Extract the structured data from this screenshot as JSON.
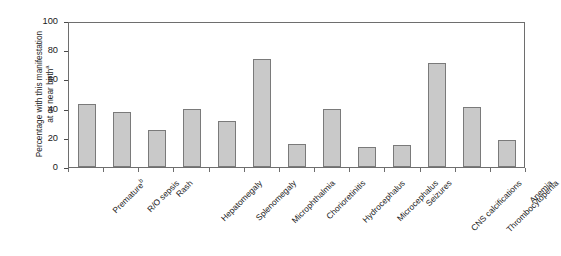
{
  "chart_data": {
    "type": "bar",
    "title": "",
    "xlabel": "",
    "ylabel": "Percentage with this manifestation at or near birth",
    "ylabel_line1": "Percentage with this manifestation",
    "ylabel_line2": "at or near birth",
    "ylabel_superscript": "a",
    "ylim": [
      0,
      100
    ],
    "yticks": [
      0,
      20,
      40,
      60,
      80,
      100
    ],
    "ytick_labels": [
      "0",
      "20",
      "40",
      "60",
      "80",
      "100"
    ],
    "grid": false,
    "legend": "none",
    "categories": [
      "Premature",
      "R/O sepsis",
      "Rash",
      "Hepatomegaly",
      "Splenomegaly",
      "Microphthalmia",
      "Chorioretinitis",
      "Hydrocephalus",
      "Microcephalus",
      "Seizures",
      "CNS calcifications",
      "Thrombocytopenia",
      "Anemia"
    ],
    "category_superscripts": [
      "b",
      "",
      "",
      "",
      "",
      "",
      "",
      "",
      "",
      "",
      "",
      "",
      ""
    ],
    "values": [
      43,
      37.5,
      25.5,
      39.5,
      31.5,
      74,
      16,
      40,
      14,
      15,
      71,
      41,
      18.5
    ],
    "bar_color": "#c9c9c9",
    "bar_border_color": "#7a7a7a",
    "axis_color": "#6e6e6e",
    "text_color": "#1a1a1a",
    "background_color": "#ffffff"
  }
}
